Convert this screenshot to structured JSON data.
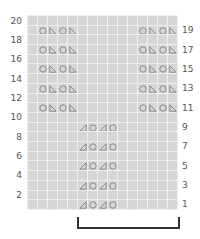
{
  "chart": {
    "title": "",
    "columns": 15,
    "rows": 20,
    "colors": {
      "cell": "#d6d6d6",
      "grid_line": "#efefef",
      "symbol": "#777777",
      "label": "#555555",
      "bracket": "#333333"
    },
    "left_row_labels": [
      "20",
      "18",
      "16",
      "14",
      "12",
      "10",
      "8",
      "6",
      "4",
      "2"
    ],
    "right_row_labels": [
      "19",
      "17",
      "15",
      "13",
      "11",
      "9",
      "7",
      "5",
      "3",
      "1"
    ],
    "symbols_legend": {
      "circle": "yarn-over",
      "triangle-left": "decrease (right angle bottom-left)",
      "triangle-right": "decrease (right angle bottom-right)"
    },
    "motifs": [
      {
        "name": "upper-left",
        "rows": [
          11,
          13,
          15,
          17,
          19
        ],
        "start_col": 2,
        "pattern": [
          "circle",
          "triangle-left",
          "circle",
          "triangle-left"
        ]
      },
      {
        "name": "upper-right",
        "rows": [
          11,
          13,
          15,
          17,
          19
        ],
        "start_col": 12,
        "pattern": [
          "circle",
          "triangle-left",
          "circle",
          "triangle-left"
        ]
      },
      {
        "name": "lower-center",
        "rows": [
          1,
          3,
          5,
          7,
          9
        ],
        "start_col": 6,
        "pattern": [
          "triangle-right",
          "circle",
          "triangle-right",
          "circle"
        ]
      }
    ],
    "repeat_bracket": {
      "from_col": 6,
      "to_col": 15
    }
  }
}
